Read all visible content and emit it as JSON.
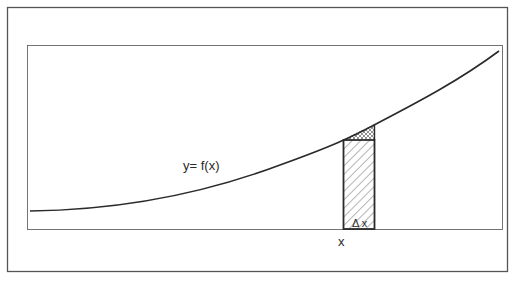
{
  "diagram": {
    "curve_label": "y= f(x)",
    "x_label": "x",
    "delta_label": "Δ x",
    "colors": {
      "line": "#2a2a2a",
      "frame": "#555555",
      "background": "#ffffff"
    },
    "elements": {
      "curve": "increasing convex curve y = f(x)",
      "strip": "hatched rectangle of width Δx at x, height f(x)",
      "cap": "cross-hatched sliver between rectangle top and curve"
    }
  }
}
